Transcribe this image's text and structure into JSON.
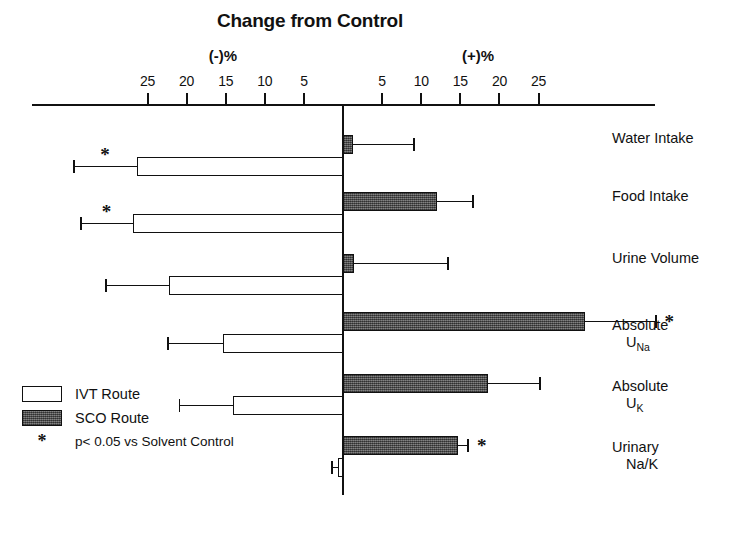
{
  "chart_data": {
    "type": "bar",
    "orientation": "horizontal",
    "title": "Change from Control",
    "xlabel": "",
    "ylabel": "",
    "axis_group_labels": {
      "negative": "(-)%",
      "positive": "(+)%"
    },
    "tick_labels_negative": [
      "25",
      "20",
      "15",
      "10",
      "5"
    ],
    "tick_labels_positive": [
      "5",
      "10",
      "15",
      "20",
      "25"
    ],
    "tick_values": [
      -25,
      -20,
      -15,
      -10,
      -5,
      5,
      10,
      15,
      20,
      25
    ],
    "xlim": [
      -40,
      40
    ],
    "grid": false,
    "legend_position": "lower-left",
    "categories": [
      "Water Intake",
      "Food Intake",
      "Urine Volume",
      "Absolute U Na",
      "Absolute U K",
      "Urinary Na/K"
    ],
    "series": [
      {
        "name": "SCO Route",
        "color": "#595959",
        "values": [
          1.3,
          12.0,
          1.4,
          31.0,
          18.5,
          14.7
        ],
        "errors": [
          7.9,
          4.7,
          12.1,
          9.1,
          6.8,
          1.4
        ],
        "significant": [
          false,
          false,
          false,
          true,
          false,
          true
        ]
      },
      {
        "name": "IVT Route",
        "color": "#ffffff",
        "values": [
          -26.3,
          -26.8,
          -22.3,
          -15.3,
          -14.1,
          -0.6
        ],
        "errors": [
          8.2,
          6.8,
          8.1,
          7.2,
          6.9,
          0.9
        ],
        "significant": [
          true,
          true,
          false,
          false,
          false,
          false
        ]
      }
    ]
  },
  "legend": {
    "items": [
      {
        "label": "IVT Route",
        "swatch": "open-rectangle"
      },
      {
        "label": "SCO Route",
        "swatch": "filled-rectangle"
      }
    ],
    "note_symbol": "*",
    "note_text": "p< 0.05 vs Solvent Control"
  },
  "category_labels": [
    {
      "line1": "Water Intake",
      "line2": "",
      "sub": ""
    },
    {
      "line1": "Food Intake",
      "line2": "",
      "sub": ""
    },
    {
      "line1": "Urine Volume",
      "line2": "",
      "sub": ""
    },
    {
      "line1": "Absolute",
      "line2": "U",
      "sub": "Na"
    },
    {
      "line1": "Absolute",
      "line2": "U",
      "sub": "K"
    },
    {
      "line1": "Urinary",
      "line2": "Na/K",
      "sub": ""
    }
  ]
}
